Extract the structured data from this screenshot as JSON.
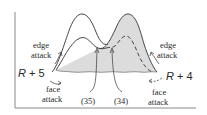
{
  "diagram": {
    "type": "reaction-energy-profile",
    "colors": {
      "line": "#333333",
      "shade": "#dcdcdc",
      "axis": "#888888",
      "background": "#ffffff"
    },
    "reactants": {
      "left": "R + 5",
      "right": "R + 4"
    },
    "labels": {
      "left_edge": [
        "edge",
        "attack"
      ],
      "left_face": [
        "face",
        "attack"
      ],
      "right_edge": [
        "edge",
        "attack"
      ],
      "right_face": [
        "face",
        "attack"
      ]
    },
    "intermediates": {
      "left": "(35)",
      "right": "(34)"
    }
  }
}
